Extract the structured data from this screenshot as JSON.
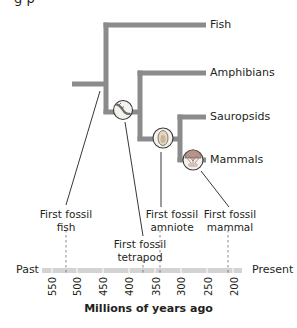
{
  "colors": {
    "branch": "#8a8b8d",
    "timeline": "#cfcfcf",
    "line": "#231f20",
    "node_ring": "#3b3b3b",
    "node_fill": "#f2efe8",
    "mammal_fill": "#b5948a",
    "amniote_fill": "#e9dcc3",
    "text": "#231f20"
  },
  "cropped_top_text": "g  p",
  "tree": {
    "taxa": [
      {
        "name": "Fish"
      },
      {
        "name": "Amphibians"
      },
      {
        "name": "Sauropsids"
      },
      {
        "name": "Mammals"
      }
    ],
    "nodes": [
      {
        "name": "tetrapod-node",
        "icon": "tetrapod-limb-icon"
      },
      {
        "name": "amniote-node",
        "icon": "amniotic-egg-icon"
      },
      {
        "name": "mammal-node",
        "icon": "mammal-embryo-icon"
      }
    ]
  },
  "events": [
    {
      "line1": "First fossil",
      "line2": "fish",
      "mya": 525
    },
    {
      "line1": "First fossil",
      "line2": "tetrapod",
      "mya": 375
    },
    {
      "line1": "First fossil",
      "line2": "amniote",
      "mya": 345
    },
    {
      "line1": "First fossil",
      "line2": "mammal",
      "mya": 210
    }
  ],
  "timeline": {
    "left_label": "Past",
    "right_label": "Present",
    "ticks": [
      "550",
      "500",
      "450",
      "400",
      "350",
      "300",
      "250",
      "200"
    ],
    "axis_title": "Millions of years ago"
  }
}
